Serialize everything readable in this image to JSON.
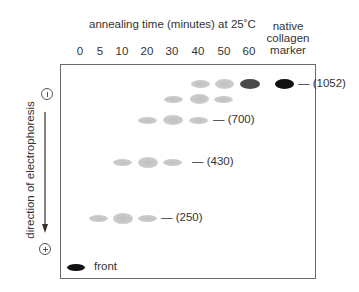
{
  "figure": {
    "title": "annealing time (minutes) at 25˚C",
    "marker_header": [
      "native",
      "collagen",
      "marker"
    ],
    "lane_labels": [
      "0",
      "5",
      "10",
      "20",
      "30",
      "40",
      "50",
      "60"
    ],
    "axis_label": "direction of electrophoresis",
    "electrodes": {
      "top": "minus-electrode",
      "bottom": "plus-electrode"
    },
    "front_label": "front",
    "size_labels": [
      "— (1052)",
      "— (700)",
      "— (430)",
      "— (250)"
    ],
    "colors": {
      "light_band": "#c8c8c8",
      "dark_band": "#4a4a4a",
      "marker_band": "#111111",
      "border": "#6a6a6a"
    }
  },
  "bands": [
    {
      "row": "1052",
      "lanes": [
        "40",
        "50",
        "60",
        "marker"
      ]
    },
    {
      "row": "intermediate",
      "lanes": [
        "30",
        "40",
        "50"
      ]
    },
    {
      "row": "700",
      "lanes": [
        "20",
        "30",
        "40"
      ]
    },
    {
      "row": "430",
      "lanes": [
        "10",
        "20",
        "30"
      ]
    },
    {
      "row": "250",
      "lanes": [
        "5",
        "10",
        "20"
      ]
    },
    {
      "row": "front",
      "lanes": [
        "0"
      ]
    }
  ]
}
